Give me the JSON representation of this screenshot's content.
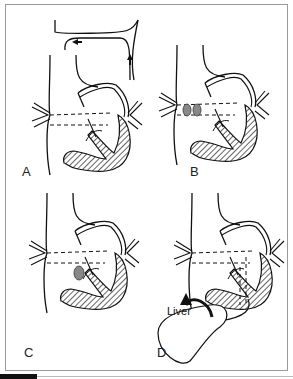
{
  "figure": {
    "panels": [
      {
        "id": "A",
        "label": "A",
        "description": "Heart with pulmonary and systemic veins; arrows indicate flow through connecting vessel"
      },
      {
        "id": "B",
        "label": "B",
        "description": "Heart with two gray oval patches between dashed atrial lines"
      },
      {
        "id": "C",
        "label": "C",
        "description": "Heart with single gray oval patch near valve"
      },
      {
        "id": "D",
        "label": "D",
        "description": "Heart with vessel connecting to liver; curved arrow"
      }
    ],
    "annotations": {
      "liver_label": "Liver"
    }
  }
}
